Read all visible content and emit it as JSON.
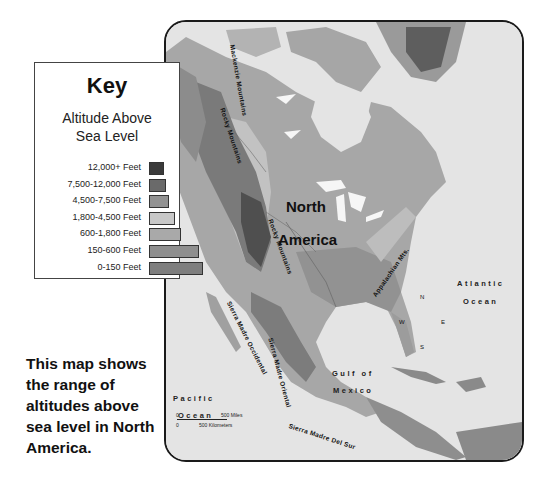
{
  "key": {
    "title": "Key",
    "subtitle_line1": "Altitude Above",
    "subtitle_line2": "Sea Level",
    "rows": [
      {
        "label": "12,000+ Feet",
        "color": "#3a3a3a",
        "width": 15
      },
      {
        "label": "7,500-12,000 Feet",
        "color": "#6a6a6a",
        "width": 17
      },
      {
        "label": "4,500-7,500 Feet",
        "color": "#929292",
        "width": 20
      },
      {
        "label": "1,800-4,500 Feet",
        "color": "#c8c8c8",
        "width": 26
      },
      {
        "label": "600-1,800 Feet",
        "color": "#a9a9a9",
        "width": 32
      },
      {
        "label": "150-600 Feet",
        "color": "#8e8e8e",
        "width": 50
      },
      {
        "label": "0-150 Feet",
        "color": "#7e7e7e",
        "width": 54
      }
    ]
  },
  "caption": "This map shows the range of altitudes above sea level in North America.",
  "map": {
    "continent_label_line1": "North",
    "continent_label_line2": "America",
    "oceans": {
      "atlantic_line1": "Atlantic",
      "atlantic_line2": "Ocean",
      "pacific_line1": "Pacific",
      "pacific_line2": "Ocean",
      "gulf_line1": "Gulf of",
      "gulf_line2": "Mexico"
    },
    "mountains": {
      "mackenzie": "Mackenzie Mountains",
      "rocky": "Rocky Mountains",
      "appalachian": "Appalachian Mts.",
      "sierra_madre_occidental": "Sierra Madre Occidental",
      "sierra_madre_oriental": "Sierra Madre Oriental",
      "sierra_madre_del_sur": "Sierra Madre Del Sur"
    },
    "compass": {
      "n": "N",
      "s": "S",
      "e": "E",
      "w": "W"
    },
    "scale": {
      "miles": "500 Miles",
      "km": "500 Kilometers",
      "zero": "0"
    }
  }
}
